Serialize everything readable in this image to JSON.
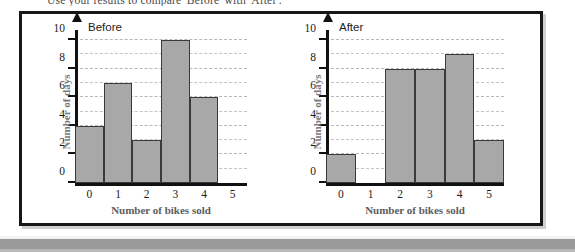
{
  "page": {
    "heading": "Use your results to compare 'Before' with 'After'."
  },
  "colors": {
    "bar_fill": "#a8a8a8",
    "bar_outline": "#3a3a3a",
    "axis": "#111111",
    "gridline": "#c3c3c8",
    "panel_border": "#17171a",
    "panel_background": "#ffffff",
    "axis_title": "#5d5d5d"
  },
  "chart_data": [
    {
      "type": "bar",
      "title": "Before",
      "xlabel": "Number of bikes sold",
      "ylabel": "Number of days",
      "categories": [
        "0",
        "1",
        "2",
        "3",
        "4",
        "5"
      ],
      "values": [
        4,
        7,
        3,
        10,
        6,
        0
      ],
      "ylim": [
        0,
        10
      ],
      "ytick_labels": [
        "0",
        "2",
        "4",
        "6",
        "8",
        "10"
      ],
      "ytick_values": [
        0,
        2,
        4,
        6,
        8,
        10
      ],
      "gridlines": [
        1,
        2,
        3,
        4,
        5,
        6,
        7,
        8,
        9,
        10
      ],
      "grid": true,
      "legend": "none"
    },
    {
      "type": "bar",
      "title": "After",
      "xlabel": "Number of bikes sold",
      "ylabel": "Number of days",
      "categories": [
        "0",
        "1",
        "2",
        "3",
        "4",
        "5"
      ],
      "values": [
        2,
        0,
        8,
        8,
        9,
        3
      ],
      "ylim": [
        0,
        10
      ],
      "ytick_labels": [
        "0",
        "2",
        "4",
        "6",
        "8",
        "10"
      ],
      "ytick_values": [
        0,
        2,
        4,
        6,
        8,
        10
      ],
      "gridlines": [
        1,
        2,
        3,
        4,
        5,
        6,
        7,
        8,
        9,
        10
      ],
      "grid": true,
      "legend": "none"
    }
  ]
}
